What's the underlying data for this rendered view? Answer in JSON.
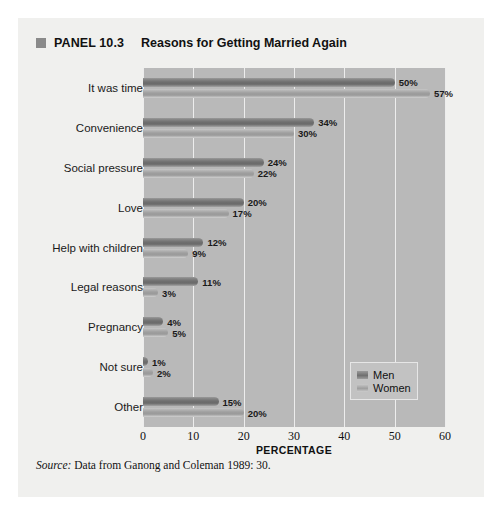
{
  "panel": {
    "marker": "square-bullet",
    "number": "PANEL 10.3",
    "title": "Reasons for Getting Married Again"
  },
  "source": {
    "label": "Source:",
    "text": "Data from Ganong and Coleman 1989: 30."
  },
  "legend": {
    "position": "inside-bottom-right",
    "entries": [
      {
        "name": "Men",
        "color": "#6f6f6f"
      },
      {
        "name": "Women",
        "color": "#9e9e9e"
      }
    ]
  },
  "chart_data": {
    "type": "bar",
    "orientation": "horizontal",
    "title": "Reasons for Getting Married Again",
    "xlabel": "PERCENTAGE",
    "ylabel": "",
    "xlim": [
      0,
      60
    ],
    "xticks": [
      0,
      10,
      20,
      30,
      40,
      50,
      60
    ],
    "grid": true,
    "value_suffix": "%",
    "categories": [
      "It was time",
      "Convenience",
      "Social pressure",
      "Love",
      "Help with children",
      "Legal reasons",
      "Pregnancy",
      "Not sure",
      "Other"
    ],
    "series": [
      {
        "name": "Men",
        "color": "#6f6f6f",
        "values": [
          50,
          34,
          24,
          20,
          12,
          11,
          4,
          1,
          15
        ]
      },
      {
        "name": "Women",
        "color": "#9e9e9e",
        "values": [
          57,
          30,
          22,
          17,
          9,
          3,
          5,
          2,
          20
        ]
      }
    ],
    "data_labels": {
      "Men": [
        "50%",
        "34%",
        "24%",
        "20%",
        "12%",
        "11%",
        "4%",
        "1%",
        "15%"
      ],
      "Women": [
        "57%",
        "30%",
        "22%",
        "17%",
        "9%",
        "3%",
        "5%",
        "2%",
        "20%"
      ]
    }
  }
}
